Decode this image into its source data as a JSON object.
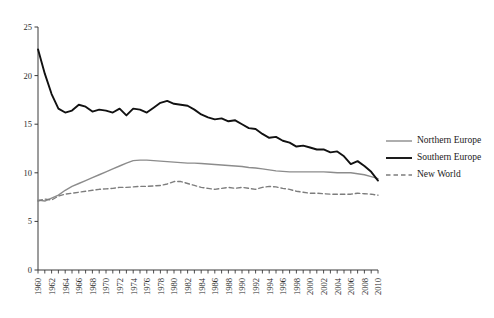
{
  "chart_data": {
    "type": "line",
    "title": "",
    "subtitle": "",
    "xlabel": "",
    "ylabel": "",
    "xlim": [
      1960,
      2010
    ],
    "ylim": [
      0,
      25
    ],
    "grid": false,
    "legend_position": "right-middle",
    "y_ticks": [
      0,
      5,
      10,
      15,
      20,
      25
    ],
    "y_tick_labels": [
      "0",
      "5",
      "10",
      "15",
      "20",
      "25"
    ],
    "x_tick_labels": [
      "1960",
      "1962",
      "1964",
      "1966",
      "1968",
      "1970",
      "1972",
      "1974",
      "1976",
      "1978",
      "1980",
      "1982",
      "1984",
      "1986",
      "1988",
      "1990",
      "1992",
      "1994",
      "1996",
      "1998",
      "2000",
      "2002",
      "2004",
      "2006",
      "2008",
      "2010"
    ],
    "x": [
      1960,
      1961,
      1962,
      1963,
      1964,
      1965,
      1966,
      1967,
      1968,
      1969,
      1970,
      1971,
      1972,
      1973,
      1974,
      1975,
      1976,
      1977,
      1978,
      1979,
      1980,
      1981,
      1982,
      1983,
      1984,
      1985,
      1986,
      1987,
      1988,
      1989,
      1990,
      1991,
      1992,
      1993,
      1994,
      1995,
      1996,
      1997,
      1998,
      1999,
      2000,
      2001,
      2002,
      2003,
      2004,
      2005,
      2006,
      2007,
      2008,
      2009,
      2010
    ],
    "series": [
      {
        "name": "Northern Europe",
        "color": "#8c8c8c",
        "style": "solid",
        "width": 1.4,
        "values": [
          7.2,
          7.1,
          7.4,
          7.7,
          8.2,
          8.6,
          8.9,
          9.2,
          9.5,
          9.8,
          10.1,
          10.4,
          10.7,
          11.0,
          11.25,
          11.3,
          11.3,
          11.25,
          11.2,
          11.15,
          11.1,
          11.05,
          11.0,
          11.0,
          10.95,
          10.9,
          10.85,
          10.8,
          10.75,
          10.7,
          10.65,
          10.55,
          10.5,
          10.4,
          10.3,
          10.2,
          10.15,
          10.1,
          10.1,
          10.1,
          10.1,
          10.1,
          10.1,
          10.05,
          10.0,
          10.0,
          10.0,
          9.9,
          9.8,
          9.6,
          9.4
        ]
      },
      {
        "name": "Southern Europe",
        "color": "#111111",
        "style": "solid",
        "width": 1.9,
        "values": [
          22.7,
          20.2,
          18.1,
          16.6,
          16.2,
          16.4,
          17.0,
          16.8,
          16.3,
          16.5,
          16.4,
          16.2,
          16.6,
          15.9,
          16.6,
          16.5,
          16.2,
          16.7,
          17.2,
          17.4,
          17.1,
          17.0,
          16.9,
          16.5,
          16.0,
          15.7,
          15.5,
          15.6,
          15.3,
          15.4,
          15.0,
          14.6,
          14.5,
          14.0,
          13.6,
          13.7,
          13.3,
          13.1,
          12.7,
          12.8,
          12.6,
          12.4,
          12.4,
          12.1,
          12.2,
          11.7,
          10.9,
          11.2,
          10.7,
          10.1,
          9.2
        ]
      },
      {
        "name": "New World",
        "color": "#7d7d7d",
        "style": "dashed",
        "width": 1.4,
        "values": [
          7.1,
          7.3,
          7.2,
          7.6,
          7.8,
          7.9,
          8.0,
          8.1,
          8.2,
          8.3,
          8.35,
          8.4,
          8.5,
          8.5,
          8.55,
          8.6,
          8.6,
          8.65,
          8.7,
          8.85,
          9.1,
          9.1,
          8.9,
          8.7,
          8.5,
          8.4,
          8.3,
          8.4,
          8.5,
          8.4,
          8.5,
          8.4,
          8.3,
          8.5,
          8.6,
          8.55,
          8.4,
          8.3,
          8.1,
          8.0,
          7.9,
          7.9,
          7.85,
          7.8,
          7.8,
          7.8,
          7.8,
          7.9,
          7.85,
          7.8,
          7.7
        ]
      }
    ],
    "legend": [
      {
        "label": "Northern Europe",
        "color": "#8c8c8c",
        "style": "solid"
      },
      {
        "label": "Southern Europe",
        "color": "#111111",
        "style": "solid"
      },
      {
        "label": "New World",
        "color": "#7d7d7d",
        "style": "dashed"
      }
    ],
    "axis_color": "#3a3a3a"
  }
}
